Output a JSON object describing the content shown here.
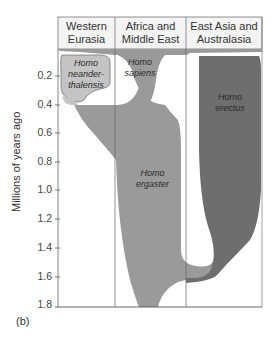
{
  "figure": {
    "panel_label": "(b)",
    "y_axis_label": "Millions of years ago",
    "y_ticks": [
      "0.2",
      "0.4",
      "0.6",
      "0.8",
      "1.0",
      "1.2",
      "1.4",
      "1.6",
      "1.8"
    ],
    "regions": [
      {
        "label_line1": "Western",
        "label_line2": "Eurasia"
      },
      {
        "label_line1": "Africa and",
        "label_line2": "Middle East"
      },
      {
        "label_line1": "East Asia and",
        "label_line2": "Australasia"
      }
    ],
    "species": [
      {
        "name1": "Homo",
        "name2": "neander-",
        "name3": "thalensis",
        "color": "#c4c4c4"
      },
      {
        "name1": "Homo",
        "name2": "sapiens",
        "color": "#9a9a9a"
      },
      {
        "name1": "Homo",
        "name2": "erectus",
        "color": "#6e6e6e"
      },
      {
        "name1": "Homo",
        "name2": "ergaster",
        "color": "#9a9a9a"
      }
    ]
  }
}
